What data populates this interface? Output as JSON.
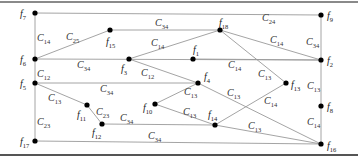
{
  "diagram": {
    "type": "graph",
    "nodes": [
      {
        "id": "f7",
        "label": "f",
        "sub": "7",
        "x": 35,
        "y": 13,
        "lx": 20,
        "ly": 17
      },
      {
        "id": "f9",
        "label": "f",
        "sub": "9",
        "x": 321,
        "y": 15,
        "lx": 327,
        "ly": 19
      },
      {
        "id": "f15",
        "label": "f",
        "sub": "15",
        "x": 110,
        "y": 30,
        "lx": 106,
        "ly": 45
      },
      {
        "id": "f18",
        "label": "f",
        "sub": "18",
        "x": 220,
        "y": 30,
        "lx": 219,
        "ly": 26
      },
      {
        "id": "f6",
        "label": "f",
        "sub": "6",
        "x": 35,
        "y": 59,
        "lx": 20,
        "ly": 63
      },
      {
        "id": "f3",
        "label": "f",
        "sub": "3",
        "x": 129,
        "y": 59,
        "lx": 121,
        "ly": 72
      },
      {
        "id": "f1",
        "label": "f",
        "sub": "1",
        "x": 193,
        "y": 59,
        "lx": 193,
        "ly": 53
      },
      {
        "id": "f2",
        "label": "f",
        "sub": "2",
        "x": 321,
        "y": 60,
        "lx": 327,
        "ly": 64
      },
      {
        "id": "f5",
        "label": "f",
        "sub": "5",
        "x": 35,
        "y": 83,
        "lx": 20,
        "ly": 87
      },
      {
        "id": "f4",
        "label": "f",
        "sub": "4",
        "x": 198,
        "y": 83,
        "lx": 204,
        "ly": 80
      },
      {
        "id": "f13",
        "label": "f",
        "sub": "13",
        "x": 286,
        "y": 83,
        "lx": 291,
        "ly": 88
      },
      {
        "id": "f8",
        "label": "f",
        "sub": "8",
        "x": 321,
        "y": 106,
        "lx": 327,
        "ly": 110
      },
      {
        "id": "f11",
        "label": "f",
        "sub": "11",
        "x": 87,
        "y": 105,
        "lx": 77,
        "ly": 118
      },
      {
        "id": "f10",
        "label": "f",
        "sub": "10",
        "x": 155,
        "y": 104,
        "lx": 143,
        "ly": 111
      },
      {
        "id": "f12",
        "label": "f",
        "sub": "12",
        "x": 102,
        "y": 124,
        "lx": 92,
        "ly": 136
      },
      {
        "id": "f14",
        "label": "f",
        "sub": "14",
        "x": 215,
        "y": 125,
        "lx": 208,
        "ly": 118
      },
      {
        "id": "f17",
        "label": "f",
        "sub": "17",
        "x": 35,
        "y": 141,
        "lx": 20,
        "ly": 145
      },
      {
        "id": "f16",
        "label": "f",
        "sub": "16",
        "x": 321,
        "y": 144,
        "lx": 327,
        "ly": 149
      }
    ],
    "edges": [
      {
        "from": "f7",
        "to": "f9",
        "label": "C",
        "sub": "24",
        "lx": 262,
        "ly": 21
      },
      {
        "from": "f7",
        "to": "f6",
        "label": "C",
        "sub": "14",
        "lx": 37,
        "ly": 41
      },
      {
        "from": "f6",
        "to": "f15",
        "label": "C",
        "sub": "25",
        "lx": 66,
        "ly": 40
      },
      {
        "from": "f15",
        "to": "f18",
        "label": "C",
        "sub": "34",
        "lx": 155,
        "ly": 26
      },
      {
        "from": "f6",
        "to": "f2",
        "label": "C",
        "sub": "34",
        "lx": 77,
        "ly": 68
      },
      {
        "from": "f3",
        "to": "f18",
        "label": "C",
        "sub": "14",
        "lx": 151,
        "ly": 46
      },
      {
        "from": "f18",
        "to": "f2",
        "label": "C",
        "sub": "14",
        "lx": 270,
        "ly": 43
      },
      {
        "from": "f9",
        "to": "f2",
        "label": "C",
        "sub": "34",
        "lx": 306,
        "ly": 45
      },
      {
        "from": "f3",
        "to": "f4",
        "label": "C",
        "sub": "12",
        "lx": 141,
        "ly": 76
      },
      {
        "from": "f1",
        "to": "f2",
        "label": "C",
        "sub": "14",
        "lx": 228,
        "ly": 68
      },
      {
        "from": "f18",
        "to": "f13",
        "label": "C",
        "sub": "13",
        "lx": 258,
        "ly": 77
      },
      {
        "from": "f6",
        "to": "f5",
        "label": "C",
        "sub": "12",
        "lx": 37,
        "ly": 77
      },
      {
        "from": "f5",
        "to": "f4",
        "label": "C",
        "sub": "34",
        "lx": 100,
        "ly": 92
      },
      {
        "from": "f2",
        "to": "f8",
        "label": "C",
        "sub": "13",
        "lx": 307,
        "ly": 89
      },
      {
        "from": "f5",
        "to": "f11",
        "label": "C",
        "sub": "13",
        "lx": 48,
        "ly": 101
      },
      {
        "from": "f4",
        "to": "f10",
        "label": "C",
        "sub": "13",
        "lx": 184,
        "ly": 95
      },
      {
        "from": "f4",
        "to": "f16",
        "label": "C",
        "sub": "13",
        "lx": 227,
        "ly": 96
      },
      {
        "from": "f13",
        "to": "f14",
        "label": "C",
        "sub": "14",
        "lx": 264,
        "ly": 104
      },
      {
        "from": "f11",
        "to": "f12",
        "label": "C",
        "sub": "23",
        "lx": 96,
        "ly": 115
      },
      {
        "from": "f12",
        "to": "f14",
        "label": "C",
        "sub": "34",
        "lx": 120,
        "ly": 121
      },
      {
        "from": "f10",
        "to": "f14",
        "label": "C",
        "sub": "13",
        "lx": 183,
        "ly": 115
      },
      {
        "from": "f14",
        "to": "f16",
        "label": "C",
        "sub": "13",
        "lx": 248,
        "ly": 129
      },
      {
        "from": "f8",
        "to": "f16",
        "label": "C",
        "sub": "14",
        "lx": 307,
        "ly": 125
      },
      {
        "from": "f5",
        "to": "f17",
        "label": "C",
        "sub": "23",
        "lx": 37,
        "ly": 125
      },
      {
        "from": "f17",
        "to": "f16",
        "label": "C",
        "sub": "34",
        "lx": 148,
        "ly": 139
      }
    ]
  }
}
